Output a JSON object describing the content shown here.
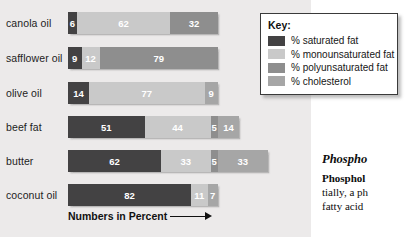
{
  "chart_data": {
    "type": "bar",
    "orientation": "horizontal",
    "stacked": true,
    "title": "",
    "xlabel": "Numbers in Percent",
    "ylabel": "",
    "categories": [
      "canola oil",
      "safflower oil",
      "olive oil",
      "beef fat",
      "butter",
      "coconut oil"
    ],
    "series": [
      {
        "name": "% saturated fat",
        "key": "sat",
        "color": "#434243",
        "values": [
          6,
          9,
          14,
          51,
          62,
          82
        ]
      },
      {
        "name": "% monounsaturated fat",
        "key": "mono",
        "color": "#c9c9c9",
        "values": [
          62,
          12,
          77,
          44,
          33,
          11
        ]
      },
      {
        "name": "% polyunsaturated fat",
        "key": "poly",
        "color": "#8e8e8e",
        "values": [
          32,
          79,
          null,
          5,
          5,
          null
        ]
      },
      {
        "name": "% cholesterol",
        "key": "chol",
        "color": "#a6a6a6",
        "values": [
          null,
          null,
          9,
          14,
          33,
          7
        ]
      }
    ],
    "rows": [
      {
        "label": "canola oil",
        "segments": [
          {
            "key": "sat",
            "value": 6
          },
          {
            "key": "mono",
            "value": 62
          },
          {
            "key": "poly",
            "value": 32
          }
        ]
      },
      {
        "label": "safflower oil",
        "segments": [
          {
            "key": "sat",
            "value": 9
          },
          {
            "key": "mono",
            "value": 12
          },
          {
            "key": "poly",
            "value": 79
          }
        ]
      },
      {
        "label": "olive oil",
        "segments": [
          {
            "key": "sat",
            "value": 14
          },
          {
            "key": "mono",
            "value": 77
          },
          {
            "key": "chol",
            "value": 9
          }
        ]
      },
      {
        "label": "beef fat",
        "segments": [
          {
            "key": "sat",
            "value": 51
          },
          {
            "key": "mono",
            "value": 44
          },
          {
            "key": "poly",
            "value": 5
          },
          {
            "key": "chol",
            "value": 14
          }
        ]
      },
      {
        "label": "butter",
        "segments": [
          {
            "key": "sat",
            "value": 62
          },
          {
            "key": "mono",
            "value": 33
          },
          {
            "key": "poly",
            "value": 5
          },
          {
            "key": "chol",
            "value": 33
          }
        ]
      },
      {
        "label": "coconut oil",
        "segments": [
          {
            "key": "sat",
            "value": 82
          },
          {
            "key": "mono",
            "value": 11
          },
          {
            "key": "chol",
            "value": 7
          }
        ]
      }
    ],
    "legend_position": "top-right",
    "grid": false
  },
  "axis": {
    "caption": "Numbers in Percent"
  },
  "legend": {
    "title": "Key:",
    "items": [
      {
        "label": "% saturated fat",
        "color": "#434243"
      },
      {
        "label": "% monounsaturated fat",
        "color": "#c9c9c9"
      },
      {
        "label": "% polyunsaturated fat",
        "color": "#8e8e8e"
      },
      {
        "label": "% cholesterol",
        "color": "#a6a6a6"
      }
    ]
  },
  "side_text": {
    "heading": "Phospho",
    "subheading": "Phosphol",
    "lines": [
      "tially, a ph",
      "fatty acid"
    ]
  }
}
